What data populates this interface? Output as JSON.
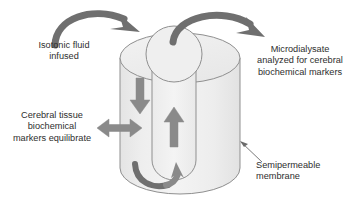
{
  "figure": {
    "colors": {
      "cylinder_fill": "#ececec",
      "cylinder_fill_light": "#f3f3f3",
      "outline": "#8f8f8f",
      "arrow_fill": "#8a8a8a",
      "arrow_dark": "#6f6f6f",
      "text": "#2e2e2e",
      "pointer_line": "#6b6b6b",
      "background": "#ffffff"
    },
    "labels": {
      "isotonic": "Isotonic fluid\ninfused",
      "microdialysate": "Microdialysate\nanalyzed for cerebral\nbiochemical markers",
      "cerebral_tissue": "Cerebral tissue\nbiochemical\nmarkers equilibrate",
      "membrane": "Semipermeable\nmembrane"
    },
    "elements": {
      "cylinder": "outer-catheter-cylinder",
      "inner_tube": "inner-perfusion-tube",
      "top_ellipse": "cylinder-top-ellipse",
      "inner_circle": "inner-tube-opening",
      "inflow_arc": "inflow-curved-arrow",
      "outflow_arc": "outflow-curved-arrow",
      "down_arrow": "downward-flow-arrow",
      "up_arrow": "upward-flow-arrow",
      "bottom_arc": "bottom-u-turn-arrow",
      "exchange_arrow": "bidirectional-exchange-arrow",
      "membrane_pointer": "membrane-pointer-line"
    }
  }
}
